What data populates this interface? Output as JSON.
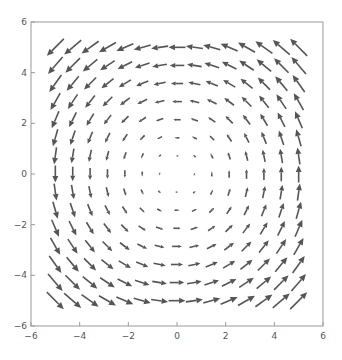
{
  "chart_data": {
    "type": "vector_field",
    "title": "",
    "xlabel": "",
    "ylabel": "",
    "field": {
      "u": "-y",
      "v": "x",
      "description": "counterclockwise rotation field"
    },
    "xlim": [
      -6,
      6
    ],
    "ylim": [
      -6,
      6
    ],
    "grid": {
      "x_min": -5,
      "x_max": 5,
      "y_min": -5,
      "y_max": 5,
      "count_x": 15,
      "count_y": 15
    },
    "x_ticks": [
      -6,
      -4,
      -2,
      0,
      2,
      4,
      6
    ],
    "y_ticks": [
      -6,
      -4,
      -2,
      0,
      2,
      4,
      6
    ],
    "x_tick_labels": [
      "−6",
      "−4",
      "−2",
      "0",
      "2",
      "4",
      "6"
    ],
    "y_tick_labels": [
      "−6",
      "−4",
      "−2",
      "0",
      "2",
      "4",
      "6"
    ],
    "gridlines": false,
    "legend": null
  },
  "style": {
    "arrow_color": "#555555",
    "frame_color": "#9a9a9a",
    "label_color": "#555555"
  }
}
